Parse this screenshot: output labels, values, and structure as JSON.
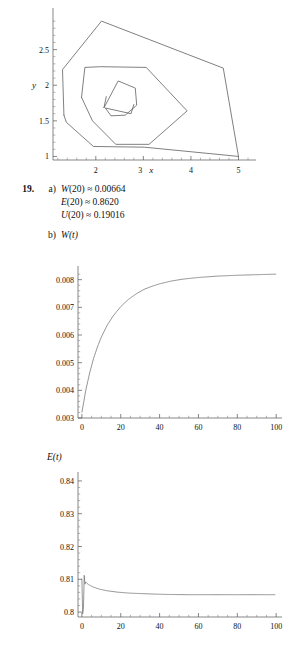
{
  "exercise": {
    "number": "19.",
    "parts": [
      {
        "label": "a)",
        "lines": [
          {
            "fn": "W",
            "arg": "(20)",
            "rel": "≈",
            "val": "0.00664"
          },
          {
            "fn": "E",
            "arg": "(20)",
            "rel": "≈",
            "val": "0.8620"
          },
          {
            "fn": "U",
            "arg": "(20)",
            "rel": "≈",
            "val": "0.19016"
          }
        ]
      },
      {
        "label": "b)",
        "plot_label": "W(t)"
      }
    ],
    "second_plot_label": "E(t)"
  },
  "chart_data": [
    {
      "type": "line",
      "name": "phase-portrait",
      "title": "",
      "xlabel": "x",
      "ylabel": "y",
      "xlim": [
        1.1,
        5.2
      ],
      "ylim": [
        0.95,
        3.0
      ],
      "xticks": [
        2,
        3,
        4,
        5
      ],
      "yticks": [
        1,
        1.5,
        2,
        2.5
      ],
      "grid": false,
      "legend": "none",
      "series": [
        {
          "name": "outer-loop",
          "x": [
            1.33,
            1.3,
            2.12,
            4.68,
            5.0,
            4.7,
            3.02,
            1.95,
            1.38,
            1.33
          ],
          "y": [
            1.58,
            2.22,
            2.9,
            2.24,
            1.0,
            1.02,
            1.13,
            1.14,
            1.48,
            1.58
          ]
        },
        {
          "name": "middle-loop",
          "x": [
            1.7,
            1.77,
            2.1,
            3.06,
            3.92,
            3.12,
            2.42,
            1.93,
            1.7
          ],
          "y": [
            1.83,
            2.25,
            2.26,
            2.25,
            1.64,
            1.17,
            1.17,
            1.5,
            1.83
          ]
        },
        {
          "name": "inner-loop",
          "x": [
            2.22,
            2.17,
            2.47,
            2.83,
            2.86,
            2.62,
            2.32,
            2.2,
            2.74,
            2.8
          ],
          "y": [
            1.84,
            1.68,
            2.06,
            1.96,
            1.72,
            1.58,
            1.57,
            1.68,
            1.6,
            1.73
          ]
        }
      ]
    },
    {
      "type": "line",
      "name": "W-of-t",
      "title": "W(t)",
      "xlabel": "",
      "ylabel": "",
      "xlim": [
        -2,
        103
      ],
      "ylim": [
        0.003,
        0.00835
      ],
      "xticks": [
        0,
        20,
        40,
        60,
        80,
        100
      ],
      "yticks": [
        0.003,
        0.004,
        0.005,
        0.006,
        0.007,
        0.008
      ],
      "ytick_labels": [
        "0.003",
        "0.004",
        "0.005",
        "0.006",
        "0.007",
        "0.008"
      ],
      "grid": false,
      "legend": "none",
      "description": "monotone increasing saturating curve from 0.0032 at t=0 to asymptote 0.00820",
      "x": [
        0,
        2,
        4,
        6,
        8,
        10,
        13,
        16,
        20,
        24,
        28,
        32,
        36,
        40,
        46,
        52,
        60,
        70,
        80,
        90,
        100
      ],
      "y": [
        0.0032,
        0.004,
        0.00463,
        0.00515,
        0.00557,
        0.00592,
        0.00635,
        0.00668,
        0.00703,
        0.00729,
        0.00749,
        0.00765,
        0.00776,
        0.00785,
        0.00795,
        0.00802,
        0.00808,
        0.00813,
        0.00816,
        0.00818,
        0.0082
      ]
    },
    {
      "type": "line",
      "name": "E-of-t",
      "title": "E(t)",
      "xlabel": "",
      "ylabel": "",
      "xlim": [
        -2,
        103
      ],
      "ylim": [
        0.7985,
        0.8415
      ],
      "xticks": [
        0,
        20,
        40,
        60,
        80,
        100
      ],
      "yticks": [
        0.8,
        0.81,
        0.82,
        0.83,
        0.84
      ],
      "ytick_labels": [
        "0.8",
        "0.81",
        "0.82",
        "0.83",
        "0.84"
      ],
      "grid": false,
      "legend": "none",
      "description": "sharp downward spike to 0.800 near t=0, rebound to 0.8112, then slow decay to flat 0.8053",
      "x": [
        0,
        0.4,
        0.8,
        1.2,
        1.6,
        2.0,
        2.6,
        3.2,
        4,
        6,
        9,
        13,
        18,
        24,
        32,
        42,
        55,
        70,
        85,
        100
      ],
      "y": [
        0.8102,
        0.7995,
        0.801,
        0.8112,
        0.8085,
        0.8092,
        0.8088,
        0.8085,
        0.8082,
        0.8076,
        0.807,
        0.8065,
        0.8061,
        0.8058,
        0.8056,
        0.8054,
        0.8053,
        0.8053,
        0.8053,
        0.8053
      ]
    }
  ]
}
